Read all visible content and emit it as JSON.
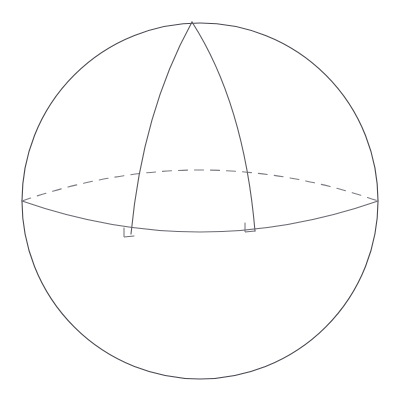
{
  "figure": {
    "kind": "geometry-diagram",
    "canvas": {
      "width": 396,
      "height": 400,
      "background": "#ffffff"
    },
    "colors": {
      "outline": "#4a4a52",
      "equator_front": "#6b6b73",
      "equator_back_dashed": "#7c7c84",
      "meridian": "#5a5a62",
      "right_angle": "#6b6b73",
      "background": "#ffffff"
    },
    "stroke_widths": {
      "outline": 1.1,
      "equator_front": 1.1,
      "equator_back_dashed": 1.1,
      "meridian": 1.1,
      "right_angle": 1.0
    },
    "dash_pattern": "9 7"
  },
  "shapes": {
    "sphere_outline": {
      "label": "sphere-outline",
      "type": "circle",
      "cx": 200,
      "cy": 201,
      "r": 178
    },
    "equator": {
      "label": "equator-ellipse",
      "type": "ellipse",
      "cx": 200,
      "cy": 201,
      "rx": 178,
      "ry": 31,
      "left_point": {
        "x": 22,
        "y": 201
      },
      "right_point": {
        "x": 378,
        "y": 201
      },
      "front_lowest_y": 232,
      "back_highest_y": 170,
      "front_path": "M 22 201 Q 200 263 378 201",
      "back_path": "M 22 201 Q 200 139 378 201"
    },
    "north_pole": {
      "label": "north-pole-vertex",
      "x": 192,
      "y": 22
    },
    "meridian_left": {
      "label": "meridian-arc-left",
      "path": "M 192 22 C 160 80 139 150 131 234",
      "foot": {
        "x": 131,
        "y": 234
      }
    },
    "meridian_right": {
      "label": "meridian-arc-right",
      "path": "M 192 22 C 228 78 248 150 255 231",
      "foot": {
        "x": 255,
        "y": 231
      }
    },
    "right_angle_left": {
      "label": "right-angle-marker-left",
      "path": "M 124 228 L 124 237 L 134 236",
      "size": 10
    },
    "right_angle_right": {
      "label": "right-angle-marker-right",
      "path": "M 245 223 L 245 232 L 255 231",
      "size": 10
    }
  },
  "accessibility": {
    "description": "Line drawing of a sphere. A horizontal great circle (the equator) is drawn as an ellipse with its front half solid and its back half dashed. Two meridian arcs run from the north pole at the top of the sphere down to the equator, meeting it at right angles marked by small squares."
  }
}
